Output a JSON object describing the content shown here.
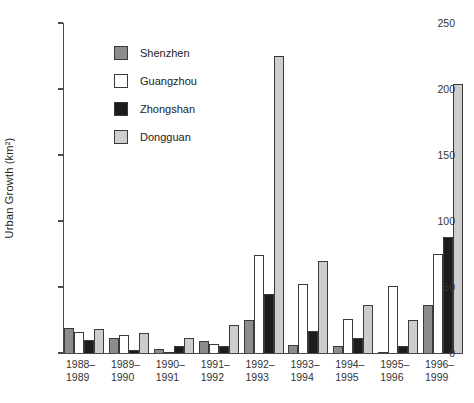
{
  "chart_data": {
    "type": "bar",
    "title": "",
    "ylabel": "Urban Growth (km²)",
    "xlabel": "",
    "ylim": [
      0,
      250
    ],
    "yticks": [
      0,
      50,
      100,
      150,
      200,
      250
    ],
    "grid": false,
    "legend_position": "upper-left-inside-plot",
    "background_color": "#ffffff",
    "axis_color": "#4a4a4a",
    "bar_border_color": "#3a3a3a",
    "categories": [
      [
        "1988–",
        "1989"
      ],
      [
        "1989–",
        "1990"
      ],
      [
        "1990–",
        "1991"
      ],
      [
        "1991–",
        "1992"
      ],
      [
        "1992–",
        "1993"
      ],
      [
        "1993–",
        "1994"
      ],
      [
        "1994–",
        "1995"
      ],
      [
        "1995–",
        "1996"
      ],
      [
        "1996–",
        "1999"
      ]
    ],
    "series": [
      {
        "name": "Shenzhen",
        "color": "#8c8c8c",
        "values": [
          19,
          11,
          3,
          9,
          25,
          6,
          5,
          1,
          36
        ]
      },
      {
        "name": "Guangzhou",
        "color": "#ffffff",
        "values": [
          16,
          14,
          1,
          7,
          74,
          52,
          26,
          51,
          75
        ]
      },
      {
        "name": "Zhongshan",
        "color": "#1c1c1c",
        "values": [
          10,
          2,
          5,
          5,
          45,
          17,
          11,
          5,
          88
        ]
      },
      {
        "name": "Dongguan",
        "color": "#cdcdcd",
        "values": [
          18,
          15,
          11,
          21,
          225,
          70,
          36,
          25,
          204
        ]
      }
    ]
  }
}
